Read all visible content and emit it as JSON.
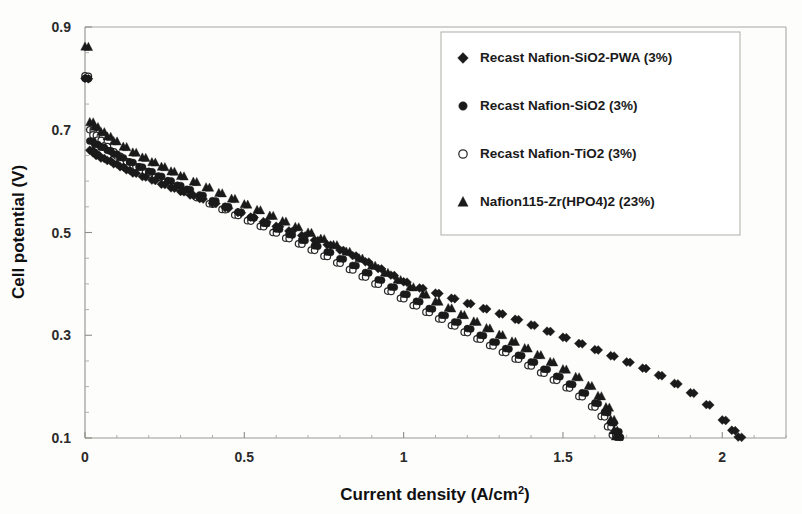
{
  "chart_data": {
    "type": "scatter",
    "title": "",
    "xlabel": "Current density (A/cm2)",
    "xlabel_base": "Current density (A/cm",
    "xlabel_sup": "2",
    "xlabel_tail": ")",
    "ylabel": "Cell potential (V)",
    "xlim": [
      0,
      2.2
    ],
    "ylim": [
      0.1,
      0.9
    ],
    "xticks": [
      "0",
      "0.5",
      "1",
      "1.5",
      "2"
    ],
    "xtick_values": [
      0,
      0.5,
      1,
      1.5,
      2
    ],
    "yticks": [
      "0.1",
      "0.3",
      "0.5",
      "0.7",
      "0.9"
    ],
    "ytick_values": [
      0.1,
      0.3,
      0.5,
      0.7,
      0.9
    ],
    "grid": false,
    "legend_position": "top-right",
    "marker_color": "#1a1a1a",
    "axis_color": "#9a9a94",
    "series": [
      {
        "name": "Recast Nafion-SiO2-PWA (3%)",
        "marker": "diamond",
        "filled": true,
        "points": [
          [
            0.0,
            0.8
          ],
          [
            0.015,
            0.66
          ],
          [
            0.025,
            0.655
          ],
          [
            0.035,
            0.65
          ],
          [
            0.05,
            0.645
          ],
          [
            0.07,
            0.64
          ],
          [
            0.09,
            0.634
          ],
          [
            0.11,
            0.628
          ],
          [
            0.13,
            0.622
          ],
          [
            0.15,
            0.616
          ],
          [
            0.18,
            0.609
          ],
          [
            0.21,
            0.602
          ],
          [
            0.24,
            0.594
          ],
          [
            0.27,
            0.587
          ],
          [
            0.3,
            0.58
          ],
          [
            0.33,
            0.573
          ],
          [
            0.36,
            0.566
          ],
          [
            0.4,
            0.557
          ],
          [
            0.44,
            0.548
          ],
          [
            0.48,
            0.539
          ],
          [
            0.52,
            0.53
          ],
          [
            0.56,
            0.521
          ],
          [
            0.6,
            0.512
          ],
          [
            0.64,
            0.503
          ],
          [
            0.68,
            0.494
          ],
          [
            0.72,
            0.485
          ],
          [
            0.76,
            0.476
          ],
          [
            0.8,
            0.466
          ],
          [
            0.84,
            0.455
          ],
          [
            0.88,
            0.443
          ],
          [
            0.92,
            0.43
          ],
          [
            0.96,
            0.417
          ],
          [
            1.0,
            0.404
          ],
          [
            1.05,
            0.392
          ],
          [
            1.1,
            0.382
          ],
          [
            1.15,
            0.372
          ],
          [
            1.2,
            0.362
          ],
          [
            1.25,
            0.352
          ],
          [
            1.3,
            0.342
          ],
          [
            1.35,
            0.331
          ],
          [
            1.4,
            0.32
          ],
          [
            1.45,
            0.308
          ],
          [
            1.5,
            0.296
          ],
          [
            1.55,
            0.284
          ],
          [
            1.6,
            0.272
          ],
          [
            1.65,
            0.26
          ],
          [
            1.7,
            0.248
          ],
          [
            1.75,
            0.236
          ],
          [
            1.8,
            0.222
          ],
          [
            1.85,
            0.206
          ],
          [
            1.9,
            0.188
          ],
          [
            1.95,
            0.165
          ],
          [
            2.0,
            0.135
          ],
          [
            2.03,
            0.115
          ],
          [
            2.05,
            0.102
          ]
        ]
      },
      {
        "name": "Recast Nafion-SiO2 (3%)",
        "marker": "circle",
        "filled": true,
        "points": [
          [
            0.0,
            0.8
          ],
          [
            0.015,
            0.678
          ],
          [
            0.03,
            0.672
          ],
          [
            0.05,
            0.666
          ],
          [
            0.07,
            0.66
          ],
          [
            0.09,
            0.653
          ],
          [
            0.11,
            0.646
          ],
          [
            0.14,
            0.637
          ],
          [
            0.17,
            0.628
          ],
          [
            0.2,
            0.619
          ],
          [
            0.23,
            0.61
          ],
          [
            0.26,
            0.601
          ],
          [
            0.29,
            0.592
          ],
          [
            0.32,
            0.584
          ],
          [
            0.36,
            0.573
          ],
          [
            0.4,
            0.562
          ],
          [
            0.44,
            0.551
          ],
          [
            0.48,
            0.54
          ],
          [
            0.52,
            0.529
          ],
          [
            0.56,
            0.518
          ],
          [
            0.6,
            0.507
          ],
          [
            0.64,
            0.496
          ],
          [
            0.68,
            0.485
          ],
          [
            0.72,
            0.474
          ],
          [
            0.76,
            0.462
          ],
          [
            0.8,
            0.449
          ],
          [
            0.84,
            0.436
          ],
          [
            0.88,
            0.422
          ],
          [
            0.92,
            0.408
          ],
          [
            0.96,
            0.394
          ],
          [
            1.0,
            0.38
          ],
          [
            1.04,
            0.366
          ],
          [
            1.08,
            0.352
          ],
          [
            1.12,
            0.339
          ],
          [
            1.16,
            0.326
          ],
          [
            1.2,
            0.313
          ],
          [
            1.24,
            0.3
          ],
          [
            1.28,
            0.287
          ],
          [
            1.32,
            0.274
          ],
          [
            1.36,
            0.261
          ],
          [
            1.4,
            0.248
          ],
          [
            1.44,
            0.234
          ],
          [
            1.48,
            0.22
          ],
          [
            1.52,
            0.205
          ],
          [
            1.56,
            0.188
          ],
          [
            1.6,
            0.168
          ],
          [
            1.63,
            0.15
          ],
          [
            1.65,
            0.13
          ],
          [
            1.665,
            0.113
          ],
          [
            1.67,
            0.102
          ]
        ]
      },
      {
        "name": "Recast Nafion-TiO2 (3%)",
        "marker": "circle",
        "filled": false,
        "points": [
          [
            0.0,
            0.805
          ],
          [
            0.015,
            0.7
          ],
          [
            0.025,
            0.69
          ],
          [
            0.04,
            0.68
          ],
          [
            0.06,
            0.668
          ],
          [
            0.08,
            0.658
          ],
          [
            0.1,
            0.649
          ],
          [
            0.13,
            0.638
          ],
          [
            0.16,
            0.628
          ],
          [
            0.19,
            0.618
          ],
          [
            0.22,
            0.608
          ],
          [
            0.25,
            0.598
          ],
          [
            0.28,
            0.589
          ],
          [
            0.31,
            0.58
          ],
          [
            0.35,
            0.568
          ],
          [
            0.39,
            0.556
          ],
          [
            0.43,
            0.545
          ],
          [
            0.47,
            0.534
          ],
          [
            0.51,
            0.523
          ],
          [
            0.55,
            0.512
          ],
          [
            0.59,
            0.5
          ],
          [
            0.63,
            0.489
          ],
          [
            0.67,
            0.478
          ],
          [
            0.71,
            0.466
          ],
          [
            0.75,
            0.454
          ],
          [
            0.79,
            0.441
          ],
          [
            0.83,
            0.428
          ],
          [
            0.87,
            0.414
          ],
          [
            0.91,
            0.4
          ],
          [
            0.95,
            0.386
          ],
          [
            0.99,
            0.372
          ],
          [
            1.03,
            0.358
          ],
          [
            1.07,
            0.345
          ],
          [
            1.11,
            0.332
          ],
          [
            1.15,
            0.319
          ],
          [
            1.19,
            0.306
          ],
          [
            1.23,
            0.293
          ],
          [
            1.27,
            0.28
          ],
          [
            1.31,
            0.267
          ],
          [
            1.35,
            0.254
          ],
          [
            1.39,
            0.241
          ],
          [
            1.43,
            0.227
          ],
          [
            1.47,
            0.213
          ],
          [
            1.51,
            0.198
          ],
          [
            1.55,
            0.181
          ],
          [
            1.59,
            0.161
          ],
          [
            1.62,
            0.142
          ],
          [
            1.64,
            0.122
          ],
          [
            1.655,
            0.106
          ]
        ]
      },
      {
        "name": "Nafion115-Zr(HPO4)2 (23%)",
        "marker": "triangle",
        "filled": true,
        "points": [
          [
            0.0,
            0.862
          ],
          [
            0.015,
            0.715
          ],
          [
            0.03,
            0.706
          ],
          [
            0.05,
            0.696
          ],
          [
            0.07,
            0.687
          ],
          [
            0.09,
            0.678
          ],
          [
            0.12,
            0.667
          ],
          [
            0.15,
            0.656
          ],
          [
            0.18,
            0.646
          ],
          [
            0.21,
            0.637
          ],
          [
            0.24,
            0.628
          ],
          [
            0.27,
            0.619
          ],
          [
            0.3,
            0.61
          ],
          [
            0.34,
            0.599
          ],
          [
            0.38,
            0.588
          ],
          [
            0.42,
            0.577
          ],
          [
            0.46,
            0.566
          ],
          [
            0.5,
            0.555
          ],
          [
            0.54,
            0.544
          ],
          [
            0.58,
            0.533
          ],
          [
            0.62,
            0.522
          ],
          [
            0.66,
            0.511
          ],
          [
            0.7,
            0.5
          ],
          [
            0.74,
            0.488
          ],
          [
            0.78,
            0.476
          ],
          [
            0.82,
            0.463
          ],
          [
            0.86,
            0.45
          ],
          [
            0.9,
            0.436
          ],
          [
            0.94,
            0.422
          ],
          [
            0.98,
            0.408
          ],
          [
            1.02,
            0.394
          ],
          [
            1.06,
            0.38
          ],
          [
            1.1,
            0.366
          ],
          [
            1.14,
            0.353
          ],
          [
            1.18,
            0.34
          ],
          [
            1.22,
            0.327
          ],
          [
            1.26,
            0.314
          ],
          [
            1.3,
            0.301
          ],
          [
            1.34,
            0.288
          ],
          [
            1.38,
            0.275
          ],
          [
            1.42,
            0.262
          ],
          [
            1.46,
            0.248
          ],
          [
            1.5,
            0.234
          ],
          [
            1.54,
            0.219
          ],
          [
            1.58,
            0.202
          ],
          [
            1.61,
            0.182
          ],
          [
            1.635,
            0.16
          ],
          [
            1.65,
            0.136
          ],
          [
            1.66,
            0.115
          ],
          [
            1.665,
            0.103
          ]
        ]
      }
    ],
    "legend": [
      {
        "label": "Recast Nafion-SiO2-PWA (3%)",
        "marker": "diamond",
        "filled": true
      },
      {
        "label": "Recast Nafion-SiO2 (3%)",
        "marker": "circle",
        "filled": true
      },
      {
        "label": "Recast Nafion-TiO2 (3%)",
        "marker": "circle-open",
        "filled": false
      },
      {
        "label": "Nafion115-Zr(HPO4)2 (23%)",
        "marker": "triangle",
        "filled": true
      }
    ]
  }
}
